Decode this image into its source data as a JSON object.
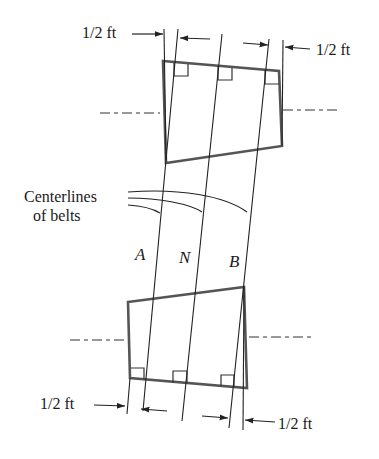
{
  "diagram": {
    "type": "belt-drive-schematic",
    "labels": {
      "top_left_dim": "1/2 ft",
      "top_right_dim": "1/2 ft",
      "bottom_left_dim": "1/2 ft",
      "bottom_right_dim": "1/2 ft",
      "centerlines_line1": "Centerlines",
      "centerlines_line2": "of belts",
      "belt_a": "A",
      "belt_n": "N",
      "belt_b": "B"
    },
    "colors": {
      "pulley_outline": "#555555",
      "line": "#222222",
      "text": "#1a1a1a",
      "background": "#ffffff"
    }
  }
}
